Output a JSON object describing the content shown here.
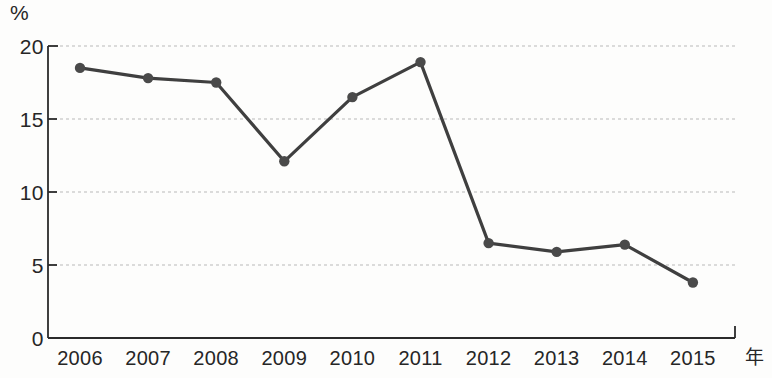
{
  "chart_data": {
    "type": "line",
    "title": "",
    "subtitle": "",
    "xlabel": "年",
    "ylabel": "%",
    "categories": [
      "2006",
      "2007",
      "2008",
      "2009",
      "2010",
      "2011",
      "2012",
      "2013",
      "2014",
      "2015"
    ],
    "values": [
      18.5,
      17.8,
      17.5,
      12.1,
      16.5,
      18.9,
      6.5,
      5.9,
      6.4,
      3.8
    ],
    "series": [
      {
        "name": "",
        "values": [
          18.5,
          17.8,
          17.5,
          12.1,
          16.5,
          18.9,
          6.5,
          5.9,
          6.4,
          3.8
        ]
      }
    ],
    "ylim": [
      0,
      20
    ],
    "yticks": [
      0,
      5,
      10,
      15,
      20
    ],
    "ytick_labels": [
      "0",
      "5",
      "10",
      "15",
      "20"
    ],
    "grid": true,
    "grid_axis": "y",
    "grid_style": "dashed",
    "legend": false,
    "legend_position": "none",
    "line_color": "#3f3f3f",
    "marker_color": "#4a4a4a",
    "marker_shape": "circle",
    "axis_color": "#2b2b2b",
    "grid_color": "#b9b9b9",
    "background_color": "#fdfdfc"
  },
  "axes": {
    "y_unit": "%",
    "x_unit": "年"
  }
}
